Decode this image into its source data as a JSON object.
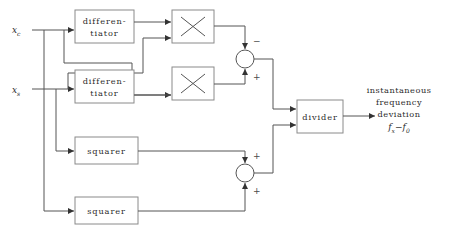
{
  "figure": {
    "background_color": "#ffffff",
    "line_color": "#555555",
    "box_stroke_color": "#8a8a8a",
    "text_color": "#2b2b2b"
  },
  "inputs": [
    {
      "id": "xc",
      "base": "x",
      "subscript": "c"
    },
    {
      "id": "xs",
      "base": "x",
      "subscript": "s"
    }
  ],
  "blocks": {
    "differentiator_top": {
      "line1": "differen-",
      "line2": "tiator"
    },
    "differentiator_bottom": {
      "line1": "differen-",
      "line2": "tiator"
    },
    "multiplier_top": {
      "symbol": "multiply-icon"
    },
    "multiplier_bottom": {
      "symbol": "multiply-icon"
    },
    "squarer_top": {
      "label": "squarer"
    },
    "squarer_bottom": {
      "label": "squarer"
    },
    "divider": {
      "label": "divider"
    }
  },
  "summing_junctions": {
    "top": {
      "sign_upper": "−",
      "sign_lower": "+"
    },
    "bottom": {
      "sign_upper": "+",
      "sign_lower": "+"
    }
  },
  "output": {
    "line1": "instantaneous",
    "line2": "frequency",
    "line3": "deviation",
    "formula_base1": "f",
    "formula_sub1": "x",
    "formula_minus": "−",
    "formula_base2": "f",
    "formula_sub2": "0"
  }
}
